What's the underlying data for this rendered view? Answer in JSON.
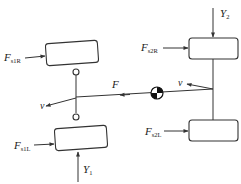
{
  "diagram": {
    "type": "vehicle force diagram (bicycle/four-wheel model, top view)",
    "labels": {
      "front_right_lateral_force": {
        "main": "F",
        "sub": "s1R"
      },
      "rear_right_lateral_force": {
        "main": "F",
        "sub": "s2R"
      },
      "front_left_lateral_force": {
        "main": "F",
        "sub": "s1L"
      },
      "rear_left_lateral_force": {
        "main": "F",
        "sub": "s2L"
      },
      "front_axle_load": {
        "main": "Y",
        "sub": "1"
      },
      "rear_axle_load": {
        "main": "Y",
        "sub": "2"
      },
      "resultant_force": {
        "main": "F"
      },
      "velocity_front": {
        "main": "v"
      },
      "velocity_rear": {
        "main": "v"
      }
    },
    "colors": {
      "line": "#333333",
      "background": "#ffffff",
      "text": "#222222"
    }
  }
}
